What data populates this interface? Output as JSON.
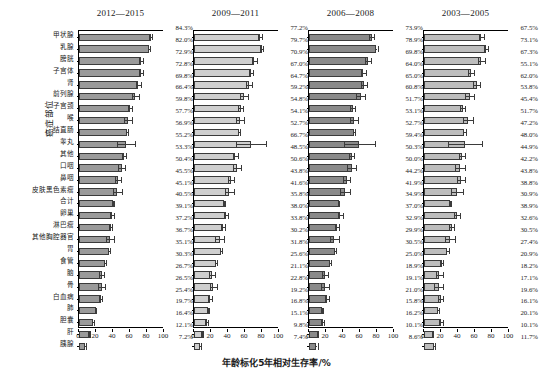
{
  "chart_data": {
    "type": "bar",
    "orientation": "horizontal",
    "title": "",
    "xlabel": "年龄标化5年相对生存率/%",
    "ylabel": "癌症部位",
    "xlim": [
      0,
      100
    ],
    "xticks": [
      0,
      20,
      40,
      60,
      80,
      100
    ],
    "grid": false,
    "legend": "none",
    "error_bars": true,
    "categories": [
      "甲状腺",
      "乳腺",
      "膀胱",
      "子宫体",
      "肾",
      "前列腺",
      "子宫颈",
      "喉",
      "结直肠",
      "睾丸",
      "其他",
      "口咽",
      "鼻咽",
      "皮肤黑色素瘤",
      "合计",
      "卵巢",
      "淋巴瘤",
      "其他胸腔器官",
      "胃",
      "食管",
      "脑",
      "骨",
      "白血病",
      "肺",
      "胆囊",
      "肝",
      "胰腺"
    ],
    "panels": [
      {
        "label": "2012—2015",
        "fill": "#9a9a9a",
        "values": [
          84.3,
          82.0,
          72.9,
          72.8,
          69.8,
          66.4,
          59.8,
          57.7,
          56.9,
          55.2,
          53.3,
          50.4,
          45.5,
          45.1,
          40.5,
          39.1,
          37.2,
          36.7,
          35.1,
          30.3,
          26.7,
          26.5,
          25.4,
          19.7,
          16.4,
          12.1,
          7.2
        ],
        "value_labels": [
          "84.3%",
          "82.0%",
          "72.9%",
          "72.8%",
          "69.8%",
          "66.4%",
          "59.8%",
          "57.7%",
          "56.9%",
          "55.2%",
          "53.3%",
          "50.4%",
          "45.5%",
          "45.1%",
          "40.5%",
          "39.1%",
          "37.2%",
          "36.7%",
          "35.1%",
          "30.3%",
          "26.7%",
          "26.5%",
          "25.4%",
          "19.7%",
          "16.4%",
          "12.1%",
          "7.2%"
        ],
        "errors": [
          2.0,
          1.3,
          2.8,
          2.3,
          2.6,
          4.4,
          2.6,
          4.4,
          1.2,
          11.0,
          2.4,
          4.2,
          3.4,
          5.2,
          0.5,
          2.3,
          2.0,
          4.6,
          1.0,
          1.1,
          3.0,
          4.0,
          2.1,
          0.7,
          1.6,
          0.6,
          1.1
        ]
      },
      {
        "label": "2009—2011",
        "fill": "#cfcfcf",
        "values": [
          77.2,
          79.7,
          70.9,
          67.0,
          64.7,
          59.2,
          54.8,
          54.1,
          52.7,
          66.7,
          48.5,
          50.6,
          43.8,
          41.6,
          35.8,
          38.0,
          33.8,
          30.2,
          31.8,
          25.6,
          21.1,
          22.8,
          19.2,
          16.8,
          15.1,
          9.8,
          7.4
        ],
        "value_labels": [
          "77.2%",
          "79.7%",
          "70.9%",
          "67.0%",
          "64.7%",
          "59.2%",
          "54.8%",
          "54.1%",
          "52.7%",
          "66.7%",
          "48.5%",
          "50.6%",
          "43.8%",
          "41.6%",
          "35.8%",
          "38.0%",
          "33.8%",
          "30.2%",
          "31.8%",
          "25.6%",
          "21.1%",
          "22.8%",
          "19.2%",
          "16.8%",
          "15.1%",
          "9.8%",
          "7.4%"
        ],
        "errors": [
          2.4,
          1.5,
          3.2,
          2.6,
          3.3,
          4.6,
          2.6,
          4.7,
          1.3,
          17.5,
          2.7,
          4.5,
          3.6,
          5.6,
          0.6,
          2.5,
          2.3,
          5.0,
          1.1,
          1.2,
          3.2,
          4.3,
          2.3,
          0.8,
          1.8,
          0.7,
          1.2
        ]
      },
      {
        "label": "2006—2008",
        "fill": "#8a8a8a",
        "values": [
          73.9,
          78.9,
          69.8,
          64.0,
          65.0,
          60.8,
          51.7,
          53.1,
          52.7,
          59.4,
          50.3,
          50.0,
          44.2,
          41.9,
          34.9,
          37.0,
          32.9,
          29.9,
          30.5,
          25.0,
          18.9,
          19.1,
          21.0,
          15.8,
          16.2,
          10.1,
          8.6
        ],
        "value_labels": [
          "73.9%",
          "78.9%",
          "69.8%",
          "64.0%",
          "65.0%",
          "60.8%",
          "51.7%",
          "53.1%",
          "52.7%",
          "59.4%",
          "50.3%",
          "50.0%",
          "44.2%",
          "41.9%",
          "34.9%",
          "37.0%",
          "32.9%",
          "29.9%",
          "30.5%",
          "25.0%",
          "18.9%",
          "19.1%",
          "21.0%",
          "15.8%",
          "16.2%",
          "10.1%",
          "8.6%"
        ],
        "errors": [
          2.8,
          1.7,
          3.6,
          3.0,
          3.6,
          5.0,
          2.9,
          5.1,
          1.5,
          18.0,
          3.0,
          4.9,
          4.0,
          6.0,
          0.7,
          2.8,
          2.6,
          5.4,
          1.3,
          1.4,
          3.5,
          4.6,
          2.6,
          0.9,
          2.0,
          0.8,
          1.4
        ]
      },
      {
        "label": "2003—2005",
        "fill": "#bdbdbd",
        "values": [
          67.5,
          73.1,
          67.3,
          55.1,
          62.0,
          53.8,
          45.4,
          51.7,
          47.2,
          48.0,
          44.9,
          42.2,
          43.8,
          38.8,
          30.9,
          38.9,
          32.6,
          30.5,
          27.4,
          20.9,
          18.2,
          17.1,
          19.6,
          16.1,
          20.1,
          10.1,
          11.7
        ],
        "value_labels": [
          "67.5%",
          "73.1%",
          "67.3%",
          "55.1%",
          "62.0%",
          "53.8%",
          "45.4%",
          "51.7%",
          "47.2%",
          "48.0%",
          "44.9%",
          "42.2%",
          "43.8%",
          "38.8%",
          "30.9%",
          "38.9%",
          "32.6%",
          "30.5%",
          "27.4%",
          "20.9%",
          "18.2%",
          "17.1%",
          "19.6%",
          "16.1%",
          "20.1%",
          "10.1%",
          "11.7%"
        ],
        "errors": [
          3.3,
          2.0,
          4.2,
          3.5,
          4.2,
          5.6,
          3.4,
          5.8,
          1.7,
          20.0,
          3.5,
          5.6,
          4.6,
          6.8,
          0.8,
          3.2,
          3.0,
          6.0,
          1.5,
          1.6,
          4.0,
          5.2,
          3.0,
          1.1,
          2.4,
          0.9,
          1.7
        ]
      }
    ]
  }
}
